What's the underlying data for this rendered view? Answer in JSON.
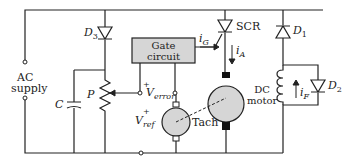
{
  "diagram": {
    "type": "circuit-schematic",
    "title": "",
    "colors": {
      "wire": "#222222",
      "component_fill": "#d6d6d6",
      "background": "#ffffff"
    },
    "source": {
      "label_line1": "AC",
      "label_line2": "supply"
    },
    "components": {
      "D3": {
        "label": "D",
        "sub": "3"
      },
      "D1": {
        "label": "D",
        "sub": "1"
      },
      "D2": {
        "label": "D",
        "sub": "2"
      },
      "SCR": {
        "label": "SCR"
      },
      "C": {
        "label": "C"
      },
      "P": {
        "label": "P"
      },
      "gate_circuit": {
        "line1": "Gate",
        "line2": "circuit"
      },
      "dc_motor": {
        "line1": "DC",
        "line2": "motor"
      },
      "tach": {
        "label": "Tach"
      }
    },
    "signals": {
      "iG": {
        "label": "i",
        "sub": "G"
      },
      "iA": {
        "label": "i",
        "sub": "A"
      },
      "iF": {
        "label": "i",
        "sub": "F"
      },
      "v_error": {
        "label": "V",
        "sub": "error",
        "polarity": "+"
      },
      "v_ref": {
        "label": "V",
        "sub": "ref",
        "polarity": "+"
      }
    }
  }
}
